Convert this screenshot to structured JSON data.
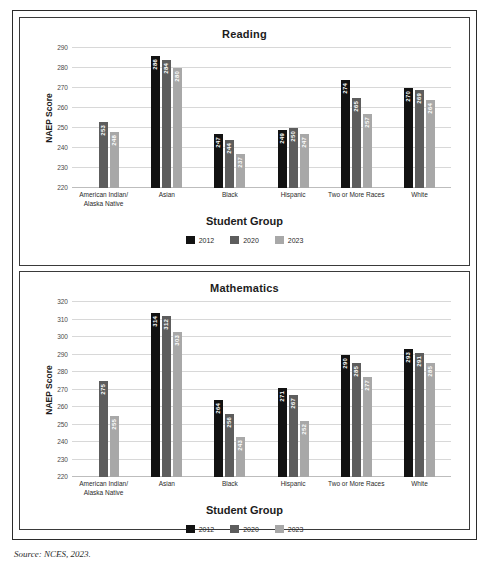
{
  "source_note": "Source: NCES, 2023.",
  "legend": {
    "items": [
      {
        "label": "2012",
        "color": "#121212",
        "key": "s2012"
      },
      {
        "label": "2020",
        "color": "#5d5d5d",
        "key": "s2020"
      },
      {
        "label": "2023",
        "color": "#a8a8a8",
        "key": "s2023"
      }
    ]
  },
  "panels": {
    "reading": {
      "title": "Reading",
      "xlabel": "Student Group",
      "ylabel": "NAEP Score"
    },
    "math": {
      "title": "Mathematics",
      "xlabel": "Student Group",
      "ylabel": "NAEP Score"
    }
  },
  "categories": [
    "American Indian/\nAlaska Native",
    "Asian",
    "Black",
    "Hispanic",
    "Two or More Races",
    "White"
  ],
  "chart_data": [
    {
      "type": "bar",
      "title": "Reading",
      "xlabel": "Student Group",
      "ylabel": "NAEP Score",
      "ylim": [
        220,
        290
      ],
      "yticks": [
        220,
        230,
        240,
        250,
        260,
        270,
        280,
        290
      ],
      "grid": true,
      "legend_position": "bottom",
      "categories": [
        "American Indian/Alaska Native",
        "Asian",
        "Black",
        "Hispanic",
        "Two or More Races",
        "White"
      ],
      "series": [
        {
          "name": "2012",
          "color": "#121212",
          "values": [
            null,
            286,
            247,
            249,
            274,
            270
          ]
        },
        {
          "name": "2020",
          "color": "#5d5d5d",
          "values": [
            253,
            284,
            244,
            250,
            265,
            269
          ]
        },
        {
          "name": "2023",
          "color": "#a8a8a8",
          "values": [
            248,
            280,
            237,
            247,
            257,
            264
          ]
        }
      ]
    },
    {
      "type": "bar",
      "title": "Mathematics",
      "xlabel": "Student Group",
      "ylabel": "NAEP Score",
      "ylim": [
        220,
        320
      ],
      "yticks": [
        220,
        230,
        240,
        250,
        260,
        270,
        280,
        290,
        300,
        310,
        320
      ],
      "grid": true,
      "legend_position": "bottom",
      "categories": [
        "American Indian/Alaska Native",
        "Asian",
        "Black",
        "Hispanic",
        "Two or More Races",
        "White"
      ],
      "series": [
        {
          "name": "2012",
          "color": "#121212",
          "values": [
            null,
            314,
            264,
            271,
            290,
            293
          ]
        },
        {
          "name": "2020",
          "color": "#5d5d5d",
          "values": [
            275,
            312,
            256,
            267,
            285,
            291
          ]
        },
        {
          "name": "2023",
          "color": "#a8a8a8",
          "values": [
            255,
            303,
            243,
            252,
            277,
            285
          ]
        }
      ]
    }
  ]
}
